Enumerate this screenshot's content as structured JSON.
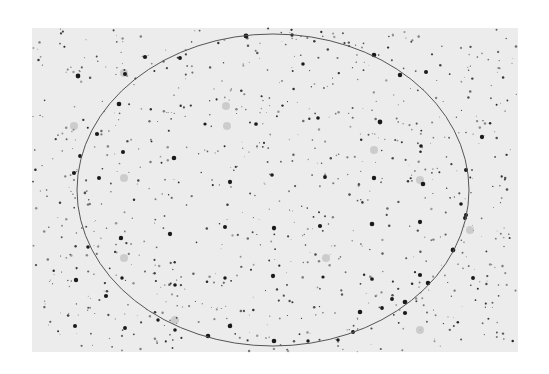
{
  "image": {
    "description": "Inverted (negative) star field photograph with a thin elliptical circle overlay",
    "background_color": "#ececec",
    "star_color": "#1a1a1a",
    "field": {
      "x": 32,
      "y": 28,
      "width": 486,
      "height": 324
    },
    "ellipse": {
      "cx": 273,
      "cy": 190,
      "rx": 196,
      "ry": 156,
      "stroke": "#555555",
      "stroke_width": 1
    },
    "bright_stars": [
      [
        78,
        76
      ],
      [
        125,
        74
      ],
      [
        180,
        58
      ],
      [
        303,
        64
      ],
      [
        374,
        55
      ],
      [
        400,
        75
      ],
      [
        426,
        72
      ],
      [
        205,
        124
      ],
      [
        256,
        124
      ],
      [
        318,
        118
      ],
      [
        380,
        122
      ],
      [
        421,
        146
      ],
      [
        482,
        137
      ],
      [
        80,
        156
      ],
      [
        123,
        152
      ],
      [
        174,
        158
      ],
      [
        230,
        182
      ],
      [
        272,
        175
      ],
      [
        325,
        177
      ],
      [
        374,
        178
      ],
      [
        423,
        184
      ],
      [
        74,
        173
      ],
      [
        99,
        178
      ],
      [
        121,
        238
      ],
      [
        170,
        234
      ],
      [
        225,
        227
      ],
      [
        274,
        228
      ],
      [
        320,
        226
      ],
      [
        372,
        224
      ],
      [
        420,
        222
      ],
      [
        465,
        218
      ],
      [
        76,
        280
      ],
      [
        122,
        278
      ],
      [
        175,
        285
      ],
      [
        225,
        278
      ],
      [
        273,
        276
      ],
      [
        323,
        277
      ],
      [
        372,
        279
      ],
      [
        420,
        275
      ],
      [
        473,
        278
      ],
      [
        75,
        326
      ],
      [
        125,
        328
      ],
      [
        175,
        330
      ],
      [
        230,
        326
      ],
      [
        308,
        341
      ],
      [
        360,
        312
      ],
      [
        392,
        299
      ],
      [
        405,
        313
      ],
      [
        353,
        332
      ],
      [
        246,
        36
      ],
      [
        292,
        35
      ],
      [
        145,
        57
      ],
      [
        119,
        104
      ],
      [
        97,
        134
      ],
      [
        466,
        170
      ],
      [
        461,
        204
      ],
      [
        466,
        215
      ],
      [
        453,
        250
      ],
      [
        428,
        283
      ],
      [
        405,
        302
      ],
      [
        382,
        308
      ],
      [
        338,
        340
      ],
      [
        274,
        341
      ],
      [
        208,
        336
      ],
      [
        158,
        320
      ],
      [
        106,
        296
      ],
      [
        88,
        247
      ]
    ],
    "faint_blobs": [
      [
        124,
        73
      ],
      [
        226,
        106
      ],
      [
        74,
        126
      ],
      [
        124,
        178
      ],
      [
        227,
        126
      ],
      [
        374,
        150
      ],
      [
        420,
        180
      ],
      [
        124,
        258
      ],
      [
        326,
        258
      ],
      [
        470,
        230
      ],
      [
        175,
        320
      ],
      [
        420,
        330
      ]
    ]
  }
}
